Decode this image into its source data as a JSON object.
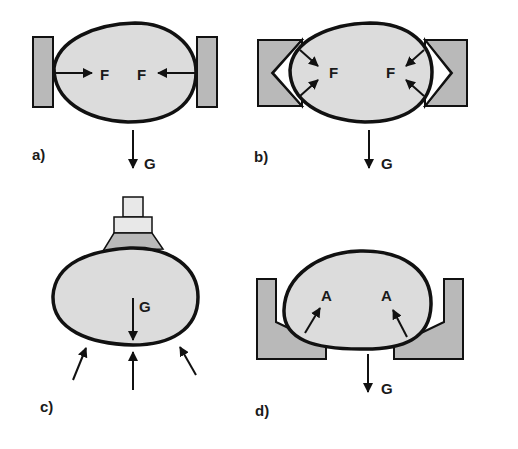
{
  "colors": {
    "object_fill": "#dcdcdc",
    "gripper_fill": "#b9b9b9",
    "stroke": "#111111",
    "background": "#ffffff"
  },
  "panels": [
    {
      "id": "a",
      "label": "a)",
      "force_labels": [
        "F",
        "F"
      ],
      "gravity_label": "G",
      "description": "Two flat jaws clamp object with opposing horizontal forces F"
    },
    {
      "id": "b",
      "label": "b)",
      "force_labels": [
        "F",
        "F"
      ],
      "gravity_label": "G",
      "description": "V-shaped jaws clamp object with angled forces F"
    },
    {
      "id": "c",
      "label": "c)",
      "force_labels": [],
      "gravity_label": "G",
      "description": "Suction cup holds object from top; support forces from below"
    },
    {
      "id": "d",
      "label": "d)",
      "force_labels": [
        "A",
        "A"
      ],
      "gravity_label": "G",
      "description": "Object rests in cradle with support forces A"
    }
  ]
}
